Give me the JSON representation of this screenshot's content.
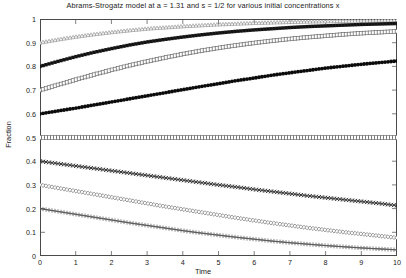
{
  "chart_data": {
    "type": "line",
    "title": "Abrams-Strogatz model at a = 1.31 and s = 1/2 for various initial concentrations x",
    "xlabel": "Time",
    "ylabel": "Fraction",
    "xlim": [
      0,
      10
    ],
    "ylim": [
      0,
      1
    ],
    "grid": false,
    "legend_position": "none",
    "xticks": [
      "0",
      "1",
      "2",
      "3",
      "4",
      "5",
      "6",
      "7",
      "8",
      "9",
      "10"
    ],
    "yticks": [
      "0",
      "0.1",
      "0.2",
      "0.3",
      "0.4",
      "0.5",
      "0.6",
      "0.7",
      "0.8",
      "0.9",
      "1"
    ],
    "x": [
      0,
      0.5,
      1,
      1.5,
      2,
      2.5,
      3,
      3.5,
      4,
      4.5,
      5,
      5.5,
      6,
      6.5,
      7,
      7.5,
      8,
      8.5,
      9,
      9.5,
      10
    ],
    "series": [
      {
        "name": "x = 0.9",
        "initial": 0.9,
        "marker": "triangle-open",
        "color": "#8c8c8c",
        "values": [
          0.9,
          0.913,
          0.925,
          0.935,
          0.944,
          0.952,
          0.959,
          0.964,
          0.969,
          0.973,
          0.977,
          0.98,
          0.983,
          0.985,
          0.987,
          0.989,
          0.99,
          0.992,
          0.993,
          0.994,
          0.995
        ]
      },
      {
        "name": "x = 0.8",
        "initial": 0.8,
        "marker": "square-filled",
        "color": "#121212",
        "values": [
          0.8,
          0.821,
          0.841,
          0.859,
          0.875,
          0.89,
          0.903,
          0.914,
          0.924,
          0.933,
          0.941,
          0.948,
          0.954,
          0.959,
          0.964,
          0.968,
          0.971,
          0.974,
          0.977,
          0.979,
          0.981
        ]
      },
      {
        "name": "x = 0.7",
        "initial": 0.7,
        "marker": "square-open",
        "color": "#6b6b6b",
        "values": [
          0.7,
          0.722,
          0.744,
          0.765,
          0.785,
          0.804,
          0.821,
          0.837,
          0.852,
          0.866,
          0.878,
          0.889,
          0.899,
          0.908,
          0.916,
          0.923,
          0.929,
          0.935,
          0.94,
          0.944,
          0.948
        ]
      },
      {
        "name": "x = 0.6",
        "initial": 0.6,
        "marker": "dot-filled",
        "color": "#0a0a0a",
        "values": [
          0.6,
          0.612,
          0.624,
          0.637,
          0.65,
          0.663,
          0.676,
          0.689,
          0.702,
          0.715,
          0.727,
          0.74,
          0.751,
          0.763,
          0.773,
          0.783,
          0.793,
          0.801,
          0.809,
          0.816,
          0.823
        ]
      },
      {
        "name": "x = 0.5",
        "initial": 0.5,
        "marker": "tick-open",
        "color": "#5a5a5a",
        "values": [
          0.5,
          0.5,
          0.5,
          0.5,
          0.5,
          0.5,
          0.5,
          0.5,
          0.5,
          0.5,
          0.5,
          0.5,
          0.5,
          0.5,
          0.5,
          0.5,
          0.5,
          0.5,
          0.5,
          0.5,
          0.5
        ]
      },
      {
        "name": "x = 0.4",
        "initial": 0.4,
        "marker": "x-cross",
        "color": "#2e2e2e",
        "values": [
          0.4,
          0.39,
          0.38,
          0.37,
          0.36,
          0.35,
          0.34,
          0.33,
          0.32,
          0.31,
          0.3,
          0.291,
          0.281,
          0.272,
          0.263,
          0.254,
          0.246,
          0.238,
          0.23,
          0.222,
          0.213
        ]
      },
      {
        "name": "x = 0.3",
        "initial": 0.3,
        "marker": "diamond-open",
        "color": "#6b6b6b",
        "values": [
          0.3,
          0.287,
          0.274,
          0.261,
          0.248,
          0.235,
          0.222,
          0.209,
          0.197,
          0.185,
          0.173,
          0.161,
          0.15,
          0.139,
          0.129,
          0.119,
          0.11,
          0.101,
          0.093,
          0.085,
          0.077
        ]
      },
      {
        "name": "x = 0.2",
        "initial": 0.2,
        "marker": "plus",
        "color": "#555555",
        "values": [
          0.2,
          0.188,
          0.176,
          0.164,
          0.152,
          0.14,
          0.129,
          0.118,
          0.107,
          0.097,
          0.088,
          0.079,
          0.071,
          0.063,
          0.056,
          0.05,
          0.044,
          0.039,
          0.034,
          0.03,
          0.026
        ]
      }
    ]
  }
}
